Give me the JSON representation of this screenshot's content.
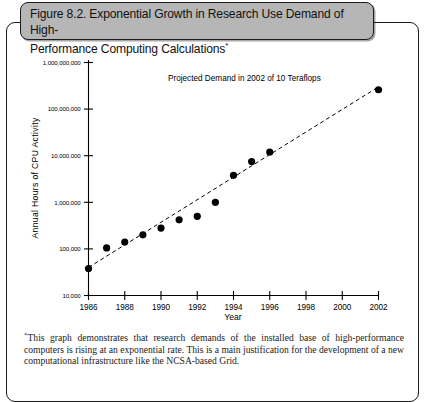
{
  "figure": {
    "title": "Figure 8.2. Exponential Growth in Research Use Demand of High-\nPerformance Computing Calculations",
    "title_footnote_marker": "*",
    "footnote_marker": "*",
    "footnote": "This graph demonstrates that research demands of the installed base of high-performance computers is rising at an exponential rate. This is a main justification for the development of a new computational infrastructure like the NCSA-based Grid.",
    "title_box_fill": "#b6b6b6",
    "title_box_border": "#1c1c1c"
  },
  "chart_data": {
    "type": "scatter",
    "xlabel": "Year",
    "ylabel": "Annual Hours of CPU Activity",
    "yscale": "log",
    "ylim": [
      10000,
      1000000000
    ],
    "xlim": [
      1986,
      2002
    ],
    "grid": false,
    "legend": false,
    "ytick_labels": [
      "1,000,000,000",
      "100,000,000",
      "10,000,000",
      "1,000,000",
      "100,000",
      "10,000"
    ],
    "ytick_values": [
      1000000000,
      100000000,
      10000000,
      1000000,
      100000,
      10000
    ],
    "xtick_labels": [
      "1986",
      "1988",
      "1990",
      "1992",
      "1994",
      "1996",
      "1998",
      "2000",
      "2002"
    ],
    "xtick_values": [
      1986,
      1988,
      1990,
      1992,
      1994,
      1996,
      1998,
      2000,
      2002
    ],
    "annotations": [
      {
        "text": "Projected Demand in 2002 of 10 Teraflops",
        "x": 1994.6,
        "y": 400000000
      }
    ],
    "series": [
      {
        "name": "Annual Hours of CPU Activity",
        "marker": "filled-circle",
        "color": "#000000",
        "x": [
          1986,
          1987,
          1988,
          1989,
          1990,
          1991,
          1992,
          1993,
          1994,
          1995,
          1996,
          2002
        ],
        "y": [
          38000,
          105000,
          140000,
          200000,
          280000,
          420000,
          500000,
          1000000,
          3800000,
          7500000,
          12000000,
          260000000
        ]
      },
      {
        "name": "Exponential trend line (projected)",
        "type": "line",
        "style": "dashed",
        "color": "#000000",
        "x": [
          1986,
          2002
        ],
        "y": [
          40000,
          300000000
        ]
      }
    ]
  }
}
